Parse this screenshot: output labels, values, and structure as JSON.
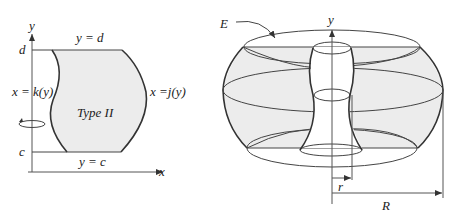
{
  "colors": {
    "region_fill": "#ececec",
    "stroke": "#333333",
    "axis": "#555555",
    "background": "#ffffff"
  },
  "left_panel": {
    "axis_x_label": "x",
    "axis_y_label": "y",
    "tick_d": "d",
    "tick_c": "c",
    "top_boundary": "y = d",
    "bottom_boundary": "y = c",
    "left_boundary": "x = k(y)",
    "right_boundary": "x =j(y)",
    "region_label": "Type II",
    "rotation_icon": "rotation-arrow-about-y-axis"
  },
  "right_panel": {
    "axis_y_label": "y",
    "solid_label": "E",
    "inner_radius_label": "r",
    "outer_radius_label": "R"
  }
}
